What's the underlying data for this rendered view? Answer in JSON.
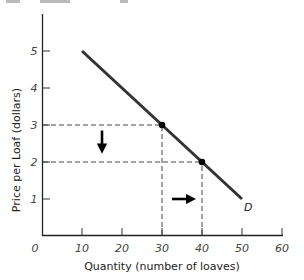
{
  "chart_data": {
    "type": "line",
    "title": "",
    "xlabel": "Quantity (number of loaves)",
    "ylabel": "Price per Loaf (dollars)",
    "xlim": [
      0,
      60
    ],
    "ylim": [
      0,
      5.9
    ],
    "x_ticks": [
      0,
      10,
      20,
      30,
      40,
      50,
      60
    ],
    "y_ticks": [
      1,
      2,
      3,
      4,
      5
    ],
    "origin_label": "0",
    "grid": false,
    "legend": null,
    "series": [
      {
        "name": "D",
        "label": "D",
        "color": "#333333",
        "x": [
          10,
          50
        ],
        "y": [
          5,
          1
        ]
      }
    ],
    "highlighted_points": [
      {
        "x": 30,
        "y": 3
      },
      {
        "x": 40,
        "y": 2
      }
    ],
    "reference_lines": [
      {
        "type": "horizontal",
        "y": 3,
        "x_from": 0,
        "x_to": 30,
        "style": "dashed"
      },
      {
        "type": "horizontal",
        "y": 2,
        "x_from": 0,
        "x_to": 40,
        "style": "dashed"
      },
      {
        "type": "vertical",
        "x": 30,
        "y_from": 0,
        "y_to": 3,
        "style": "dashed"
      },
      {
        "type": "vertical",
        "x": 40,
        "y_from": 0,
        "y_to": 2,
        "style": "dashed"
      }
    ],
    "annotations": [
      {
        "type": "arrow",
        "direction": "down",
        "meaning": "price falls from $3 to $2",
        "x": 15,
        "y_from": 2.85,
        "y_to": 2.2
      },
      {
        "type": "arrow",
        "direction": "right",
        "meaning": "quantity demanded rises from 30 to 40",
        "y": 1,
        "x_from": 32,
        "x_to": 39
      }
    ]
  }
}
